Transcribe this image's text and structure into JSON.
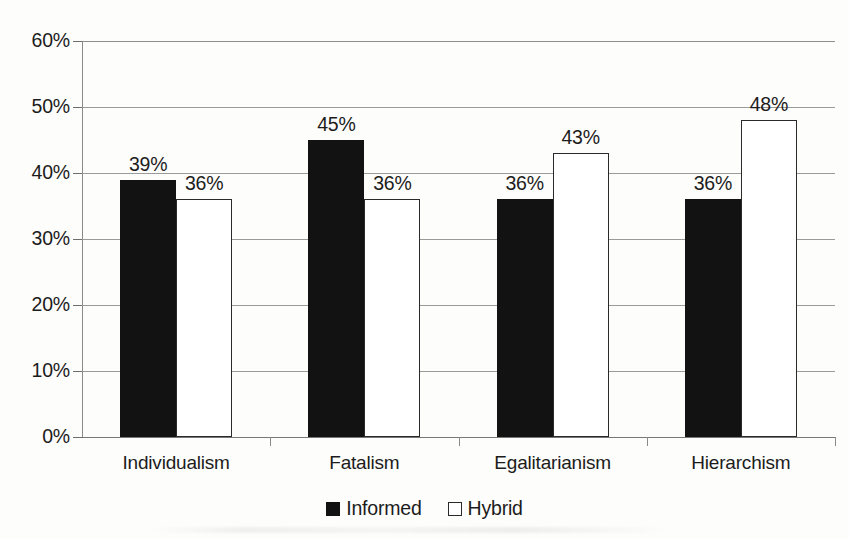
{
  "chart_data": {
    "type": "bar",
    "title": "",
    "subtitle": "",
    "xlabel": "",
    "ylabel": "",
    "categories": [
      "Individualism",
      "Fatalism",
      "Egalitarianism",
      "Hierarchism"
    ],
    "series": [
      {
        "name": "Informed",
        "color": "#121212",
        "values": [
          39,
          45,
          36,
          36
        ],
        "labels": [
          "39%",
          "45%",
          "36%",
          "36%"
        ]
      },
      {
        "name": "Hybrid",
        "color": "#ffffff",
        "values": [
          36,
          36,
          43,
          48
        ],
        "labels": [
          "36%",
          "36%",
          "43%",
          "48%"
        ]
      }
    ],
    "ylim": [
      0,
      60
    ],
    "ytick_values": [
      0,
      10,
      20,
      30,
      40,
      50,
      60
    ],
    "ytick_labels": [
      "0%",
      "10%",
      "20%",
      "30%",
      "40%",
      "50%",
      "60%"
    ],
    "grid": true,
    "legend_position": "bottom",
    "value_format": "percent"
  },
  "legend": {
    "items": [
      {
        "label": "Informed",
        "marker": "filled-square"
      },
      {
        "label": "Hybrid",
        "marker": "outlined-square"
      }
    ]
  },
  "axes": {
    "y_axis_name": "percentage-axis",
    "x_axis_name": "culture-type-axis"
  }
}
